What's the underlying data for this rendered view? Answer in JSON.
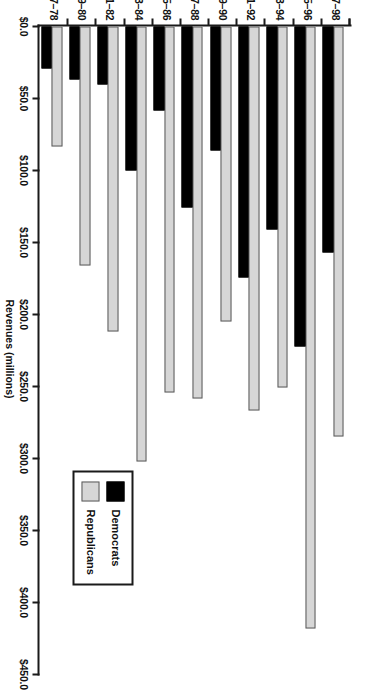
{
  "chart_data": {
    "type": "bar",
    "orientation": "horizontal",
    "title": "",
    "xlabel": "Revenues (millions)",
    "ylabel": "",
    "xlim": [
      0,
      450
    ],
    "xtick_labels": [
      "$0.0",
      "$50.0",
      "$100.0",
      "$150.0",
      "$200.0",
      "$250.0",
      "$300.0",
      "$350.0",
      "$400.0",
      "$450.0"
    ],
    "xtick_values": [
      0,
      50,
      100,
      150,
      200,
      250,
      300,
      350,
      400,
      450
    ],
    "grid": false,
    "legend_position": "lower-left",
    "categories": [
      "1977–78",
      "1979–80",
      "1981–82",
      "1983–84",
      "1985–86",
      "1987–88",
      "1989–90",
      "1991–92",
      "1993–94",
      "1995–96",
      "1997–98"
    ],
    "series": [
      {
        "name": "Democrats",
        "color": "#000000",
        "values": [
          29.0,
          37.0,
          40.0,
          100.0,
          58.0,
          126.0,
          86.0,
          174.0,
          141.0,
          222.0,
          157.0
        ]
      },
      {
        "name": "Republicans",
        "color": "#d6d6d6",
        "values": [
          83.0,
          166.0,
          212.0,
          302.0,
          254.0,
          258.0,
          205.0,
          267.0,
          251.0,
          418.0,
          285.0
        ]
      }
    ]
  },
  "legend": {
    "entries": [
      {
        "label": "Democrats",
        "swatch": "dem"
      },
      {
        "label": "Republicans",
        "swatch": "rep"
      }
    ]
  },
  "axis": {
    "value_axis_title": "Revenues (millions)"
  }
}
